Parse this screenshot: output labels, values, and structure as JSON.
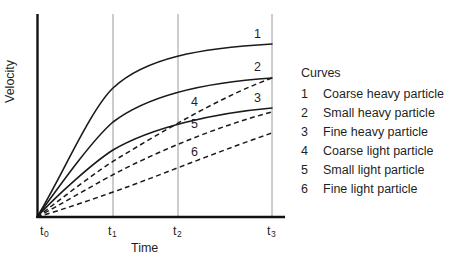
{
  "chart_data": {
    "type": "line",
    "title": "",
    "xlabel": "Time",
    "ylabel": "Velocity",
    "grid": true,
    "legend_position": "right",
    "legend_title": "Curves",
    "x_ticks": [
      {
        "label_base": "t",
        "label_sub": "0",
        "x_px": 40
      },
      {
        "label_base": "t",
        "label_sub": "1",
        "x_px": 108
      },
      {
        "label_base": "t",
        "label_sub": "2",
        "x_px": 173
      },
      {
        "label_base": "t",
        "label_sub": "3",
        "x_px": 267
      }
    ],
    "gridline_x_px": [
      113,
      178,
      272
    ],
    "axis_origin_px": {
      "x": 37,
      "y": 217
    },
    "axis_top_px": 14,
    "axis_right_px": 285,
    "series": [
      {
        "name": "Coarse heavy particle",
        "number": "1",
        "style": "solid",
        "color": "#1a1a1a",
        "path": "M 37 217 C 60 180, 90 110, 113 88 C 145 58, 200 48, 272 44",
        "label_x": 254,
        "label_y": 28
      },
      {
        "name": "Small heavy particle",
        "number": "2",
        "style": "solid",
        "color": "#1a1a1a",
        "path": "M 37 217 C 58 188, 92 140, 113 122 C 150 94, 210 82, 272 78",
        "label_x": 254,
        "label_y": 61
      },
      {
        "name": "Fine heavy particle",
        "number": "3",
        "style": "solid",
        "color": "#1a1a1a",
        "path": "M 37 217 C 56 196, 94 162, 113 150 C 152 127, 215 113, 272 108",
        "label_x": 254,
        "label_y": 92
      },
      {
        "name": "Coarse light particle",
        "number": "4",
        "style": "dashed",
        "color": "#1a1a1a",
        "path": "M 37 217 C 60 200, 95 172, 120 157 C 170 127, 225 95, 272 78",
        "label_x": 191,
        "label_y": 96
      },
      {
        "name": "Small light particle",
        "number": "5",
        "style": "dashed",
        "color": "#1a1a1a",
        "path": "M 37 217 C 62 204, 98 182, 124 169 C 172 145, 226 124, 272 112",
        "label_x": 191,
        "label_y": 118
      },
      {
        "name": "Fine light particle",
        "number": "6",
        "style": "dashed",
        "color": "#1a1a1a",
        "path": "M 37 217 C 65 209, 102 196, 130 186 C 178 168, 228 148, 272 133",
        "label_x": 191,
        "label_y": 146
      }
    ]
  },
  "axes": {
    "x_title": "Time",
    "y_title": "Velocity"
  },
  "legend": {
    "title": "Curves",
    "entries": [
      {
        "number": "1",
        "label": "Coarse heavy particle"
      },
      {
        "number": "2",
        "label": "Small heavy particle"
      },
      {
        "number": "3",
        "label": "Fine heavy particle"
      },
      {
        "number": "4",
        "label": "Coarse light particle"
      },
      {
        "number": "5",
        "label": "Small light particle"
      },
      {
        "number": "6",
        "label": "Fine light particle"
      }
    ]
  },
  "colors": {
    "background": "#ffffff",
    "axis": "#111111",
    "gridline": "#9a9a9a",
    "curve": "#1a1a1a",
    "text": "#1f1f1f"
  }
}
